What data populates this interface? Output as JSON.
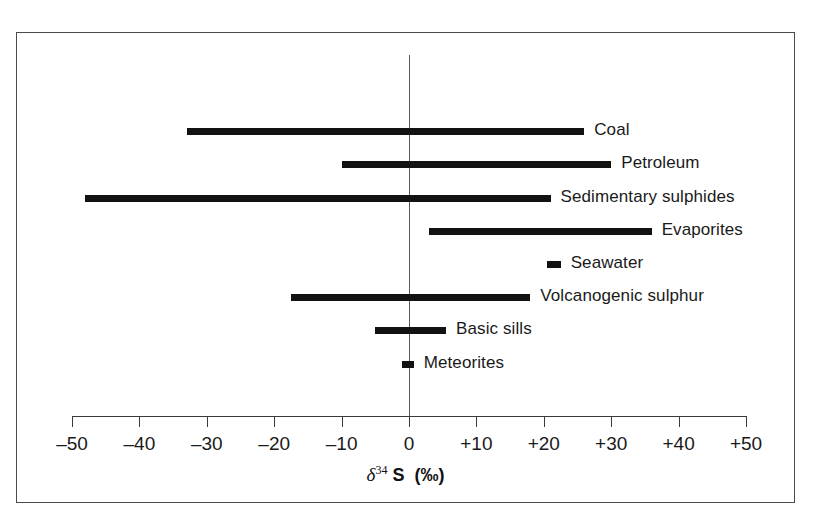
{
  "figure": {
    "background_color": "#ffffff",
    "frame_color": "#4a4a4a",
    "bar_color": "#121212",
    "axis_color": "#3a3a3a",
    "zero_line_color": "#5a5a5a"
  },
  "chart_data": {
    "type": "bar",
    "orientation": "horizontal",
    "title": "",
    "subtitle": "",
    "xlabel": "δ³⁴ S (‰)",
    "xlabel_parts": {
      "delta": "δ",
      "superscript": "34",
      "element": "S",
      "units": "(‰)"
    },
    "ylabel": "",
    "xlim": [
      -50,
      50
    ],
    "xticks": [
      -50,
      -40,
      -30,
      -20,
      -10,
      0,
      10,
      20,
      30,
      40,
      50
    ],
    "xticklabels": [
      "–50",
      "–40",
      "–30",
      "–20",
      "–10",
      "0",
      "+10",
      "+20",
      "+30",
      "+40",
      "+50"
    ],
    "grid": false,
    "legend": false,
    "zero_reference_line": 0,
    "categories": [
      "Coal",
      "Petroleum",
      "Sedimentary sulphides",
      "Evaporites",
      "Seawater",
      "Volcanogenic sulphur",
      "Basic sills",
      "Meteorites"
    ],
    "ranges": [
      {
        "label": "Coal",
        "start": -33,
        "end": 26
      },
      {
        "label": "Petroleum",
        "start": -10,
        "end": 30
      },
      {
        "label": "Sedimentary sulphides",
        "start": -48,
        "end": 21
      },
      {
        "label": "Evaporites",
        "start": 3,
        "end": 36
      },
      {
        "label": "Seawater",
        "start": 20.5,
        "end": 22.5
      },
      {
        "label": "Volcanogenic sulphur",
        "start": -17.5,
        "end": 18
      },
      {
        "label": "Basic sills",
        "start": -5,
        "end": 5.5
      },
      {
        "label": "Meteorites",
        "start": -1,
        "end": 0.7
      }
    ]
  }
}
